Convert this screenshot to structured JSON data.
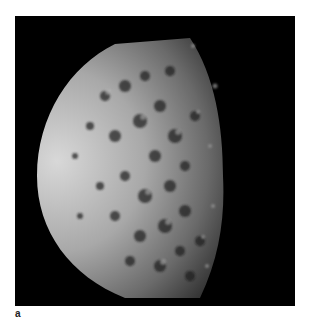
{
  "figure": {
    "panel_label": "a",
    "background_color": "#000000",
    "page_color": "#ffffff"
  }
}
